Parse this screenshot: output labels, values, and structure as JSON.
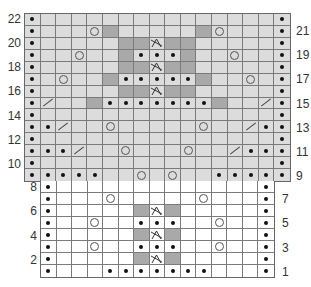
{
  "legend_symbols": {
    "dot": "purl-dot-icon",
    "yo": "yarn-over-circle-icon",
    "k2tog": "k2tog-slash-icon",
    "sk2p": "sk2p-decrease-icon",
    "dark": "contrast-shaded-cell"
  },
  "colors": {
    "upper_fill": "#dcdcdc",
    "lower_fill": "#ffffff",
    "dark_fill": "#a9a9a9",
    "grid_line": "#7a7a7a"
  },
  "upper_chart": {
    "columns": 17,
    "rows": [
      {
        "row": 22,
        "label_side": "left",
        "cells": {
          "0": "dot",
          "16": "dot"
        }
      },
      {
        "row": 21,
        "label_side": "right",
        "cells": {
          "0": "dot",
          "4": "yo",
          "5": "dark",
          "11": "dark",
          "12": "yo",
          "16": "dot"
        }
      },
      {
        "row": 20,
        "label_side": "left",
        "cells": {
          "0": "dot",
          "6": "dark",
          "7": "dark",
          "8": "sk2p",
          "9": "dark",
          "10": "dark",
          "16": "dot"
        }
      },
      {
        "row": 19,
        "label_side": "right",
        "cells": {
          "0": "dot",
          "3": "yo",
          "6": "dark",
          "7": "dot",
          "8": "dot",
          "9": "dot",
          "10": "dark",
          "13": "yo",
          "16": "dot"
        }
      },
      {
        "row": 18,
        "label_side": "left",
        "cells": {
          "0": "dot",
          "6": "dark",
          "7": "dark",
          "8": "sk2p",
          "9": "dark",
          "10": "dark",
          "16": "dot"
        }
      },
      {
        "row": 17,
        "label_side": "right",
        "cells": {
          "0": "dot",
          "2": "yo",
          "5": "dark",
          "6": "dot",
          "7": "dot",
          "8": "dot",
          "9": "dot",
          "10": "dot",
          "11": "dark",
          "14": "yo",
          "16": "dot"
        }
      },
      {
        "row": 16,
        "label_side": "left",
        "cells": {
          "0": "dot",
          "6": "dark",
          "7": "dark",
          "8": "sk2p",
          "9": "dark",
          "10": "dark",
          "16": "dot"
        }
      },
      {
        "row": 15,
        "label_side": "right",
        "cells": {
          "0": "dot",
          "1": "k2tog",
          "4": "dark",
          "5": "dot",
          "6": "dot",
          "7": "dot",
          "8": "dot",
          "9": "dot",
          "10": "dot",
          "11": "dot",
          "12": "dark",
          "15": "k2tog",
          "16": "dot"
        }
      },
      {
        "row": 14,
        "label_side": "left",
        "cells": {
          "0": "dot",
          "16": "dot"
        }
      },
      {
        "row": 13,
        "label_side": "right",
        "cells": {
          "0": "dot",
          "1": "dot",
          "2": "k2tog",
          "5": "yo",
          "11": "yo",
          "14": "k2tog",
          "15": "dot",
          "16": "dot"
        }
      },
      {
        "row": 12,
        "label_side": "left",
        "cells": {
          "0": "dot",
          "16": "dot"
        }
      },
      {
        "row": 11,
        "label_side": "right",
        "cells": {
          "0": "dot",
          "1": "dot",
          "2": "dot",
          "3": "k2tog",
          "6": "yo",
          "10": "yo",
          "13": "k2tog",
          "14": "dot",
          "15": "dot",
          "16": "dot"
        }
      },
      {
        "row": 10,
        "label_side": "left",
        "cells": {
          "0": "dot",
          "16": "dot"
        }
      },
      {
        "row": 9,
        "label_side": "right",
        "cells": {
          "0": "dot",
          "1": "dot",
          "2": "dot",
          "3": "dot",
          "4": "dot",
          "7": "yo",
          "9": "yo",
          "12": "dot",
          "13": "dot",
          "14": "dot",
          "15": "dot",
          "16": "dot"
        }
      }
    ]
  },
  "lower_chart": {
    "columns": 15,
    "rows": [
      {
        "row": 8,
        "label_side": "left",
        "cells": {
          "0": "dot",
          "14": "dot"
        }
      },
      {
        "row": 7,
        "label_side": "right",
        "cells": {
          "0": "dot",
          "4": "yo",
          "10": "yo",
          "14": "dot"
        }
      },
      {
        "row": 6,
        "label_side": "left",
        "cells": {
          "0": "dot",
          "6": "dark",
          "7": "sk2p",
          "8": "dark",
          "14": "dot"
        }
      },
      {
        "row": 5,
        "label_side": "right",
        "cells": {
          "0": "dot",
          "3": "yo",
          "6": "dot",
          "7": "dot",
          "8": "dot",
          "11": "yo",
          "14": "dot"
        }
      },
      {
        "row": 4,
        "label_side": "left",
        "cells": {
          "0": "dot",
          "6": "dark",
          "7": "sk2p",
          "8": "dark",
          "14": "dot"
        }
      },
      {
        "row": 3,
        "label_side": "right",
        "cells": {
          "0": "dot",
          "3": "yo",
          "6": "dot",
          "7": "dot",
          "8": "dot",
          "11": "yo",
          "14": "dot"
        }
      },
      {
        "row": 2,
        "label_side": "left",
        "cells": {
          "0": "dot",
          "6": "dark",
          "7": "sk2p",
          "8": "dark",
          "14": "dot"
        }
      },
      {
        "row": 1,
        "label_side": "right",
        "cells": {
          "0": "dot",
          "4": "dot",
          "5": "dot",
          "6": "dot",
          "7": "dot",
          "8": "dot",
          "9": "dot",
          "10": "dot",
          "14": "dot"
        }
      }
    ]
  },
  "row_labels": {
    "upper_left": [
      "22",
      "20",
      "18",
      "16",
      "14",
      "12",
      "10"
    ],
    "upper_right": [
      "21",
      "19",
      "17",
      "15",
      "13",
      "11",
      "9"
    ],
    "lower_left": [
      "8",
      "6",
      "4",
      "2"
    ],
    "lower_right": [
      "7",
      "5",
      "3",
      "1"
    ]
  }
}
